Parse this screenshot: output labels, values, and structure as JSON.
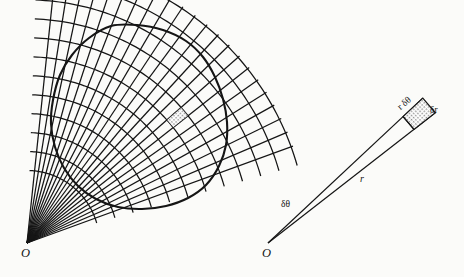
{
  "figure": {
    "background_color": "#fbfbf9",
    "ink_color": "#151515",
    "shade_color": "#b9b9b9"
  },
  "left_panel": {
    "name": "region-with-polar-grid",
    "origin_label": "O",
    "origin": {
      "x": 27,
      "y": 243
    },
    "shaded_cell": {
      "x": 185,
      "y": 113,
      "label": ""
    },
    "blob": {
      "description": "closed smooth region",
      "points": [
        [
          111,
          26
        ],
        [
          137,
          25
        ],
        [
          163,
          30
        ],
        [
          186,
          41
        ],
        [
          203,
          57
        ],
        [
          215,
          77
        ],
        [
          223,
          99
        ],
        [
          227,
          122
        ],
        [
          226,
          145
        ],
        [
          219,
          166
        ],
        [
          206,
          185
        ],
        [
          188,
          198
        ],
        [
          166,
          206
        ],
        [
          142,
          209
        ],
        [
          118,
          207
        ],
        [
          96,
          199
        ],
        [
          78,
          186
        ],
        [
          64,
          168
        ],
        [
          55,
          147
        ],
        [
          51,
          124
        ],
        [
          53,
          100
        ],
        [
          60,
          75
        ],
        [
          72,
          55
        ],
        [
          89,
          38
        ]
      ]
    },
    "radial_lines": {
      "count": 22,
      "angle_start_deg": -84.0,
      "angle_end_deg": -20.0
    },
    "arc_count": 11
  },
  "right_panel": {
    "name": "magnified-wedge-element",
    "origin_label": "O",
    "origin": {
      "x": 268,
      "y": 243
    },
    "axis_angle_deg": -40.5,
    "wedge_half_angle_deg": 2.6,
    "inner_radius": 185,
    "outer_radius": 212,
    "labels": {
      "radius": "r",
      "angle": "δθ",
      "arc": "r δθ",
      "radial_thickness": "δr"
    },
    "label_positions": {
      "radius": {
        "x": 360,
        "y": 180
      },
      "angle": {
        "x": 285,
        "y": 205
      },
      "arc": {
        "x": 397,
        "y": 110
      },
      "radial_thickness": {
        "x": 431,
        "y": 111
      }
    }
  }
}
